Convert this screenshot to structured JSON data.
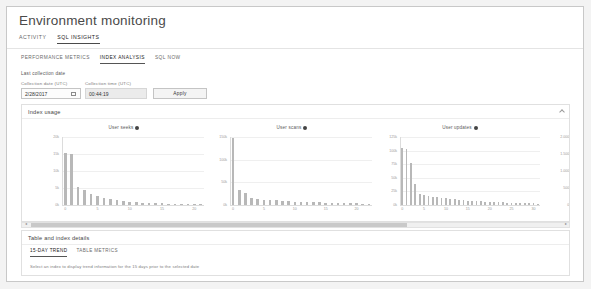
{
  "header": {
    "title": "Environment monitoring",
    "tabs": [
      {
        "label": "ACTIVITY",
        "active": false
      },
      {
        "label": "SQL INSIGHTS",
        "active": true
      }
    ]
  },
  "subtabs": [
    {
      "label": "PERFORMANCE METRICS",
      "active": false
    },
    {
      "label": "INDEX ANALYSIS",
      "active": true
    },
    {
      "label": "SQL NOW",
      "active": false
    }
  ],
  "filters": {
    "section_label": "Last collection date",
    "date_label": "Collection date (UTC)",
    "date_value": "2/28/2017",
    "calendar_icon": "calendar-icon",
    "time_label": "Collection time (UTC)",
    "time_value": "00:44:19",
    "apply_label": "Apply"
  },
  "index_panel": {
    "title": "Index usage",
    "collapse_icon": "chevron-up-icon"
  },
  "table_panel": {
    "title": "Table and index details",
    "tabs": [
      {
        "label": "15-DAY TREND",
        "active": true
      },
      {
        "label": "TABLE METRICS",
        "active": false
      }
    ],
    "hint": "Select an index to display trend information for the 15 days prior to the selected date"
  },
  "scrollbar": {
    "left_arrow": "◂",
    "right_arrow": "▸"
  },
  "chart_data": [
    {
      "type": "bar",
      "title": "User seeks",
      "info_icon": "info-icon",
      "xlabel": "",
      "ylabel": "",
      "ylim": [
        0,
        20000
      ],
      "yticks": [
        0,
        5000,
        10000,
        15000,
        20000
      ],
      "ytick_labels": [
        "0k",
        "5k",
        "10k",
        "15k",
        "20k"
      ],
      "xticks": [
        0,
        5,
        10,
        15,
        20
      ],
      "xtick_labels": [
        "0",
        "5",
        "10",
        "15",
        "20"
      ],
      "categories": [
        "0",
        "1",
        "2",
        "3",
        "4",
        "5",
        "6",
        "7",
        "8",
        "9",
        "10",
        "11",
        "12",
        "13",
        "14",
        "15",
        "16",
        "17",
        "18",
        "19",
        "20",
        "21"
      ],
      "values": [
        15300,
        15100,
        5200,
        4300,
        3100,
        2600,
        2100,
        1700,
        1400,
        1100,
        900,
        800,
        700,
        600,
        520,
        460,
        400,
        360,
        320,
        290,
        260,
        240
      ]
    },
    {
      "type": "bar",
      "title": "User scans",
      "info_icon": "info-icon",
      "xlabel": "",
      "ylabel": "",
      "ylim": [
        0,
        150000
      ],
      "yticks": [
        0,
        50000,
        100000,
        150000
      ],
      "ytick_labels": [
        "0k",
        "50k",
        "100k",
        "150k"
      ],
      "xticks": [
        0,
        5,
        10,
        15,
        20
      ],
      "xtick_labels": [
        "0",
        "5",
        "10",
        "15",
        "20"
      ],
      "categories": [
        "0",
        "1",
        "2",
        "3",
        "4",
        "5",
        "6",
        "7",
        "8",
        "9",
        "10",
        "11",
        "12",
        "13",
        "14",
        "15",
        "16",
        "17",
        "18",
        "19",
        "20",
        "21",
        "22"
      ],
      "values": [
        148000,
        33000,
        26000,
        15000,
        13000,
        12000,
        11000,
        10000,
        9000,
        8200,
        7500,
        7000,
        6500,
        6000,
        5600,
        5200,
        4800,
        4500,
        4200,
        3900,
        3600,
        3300,
        3000
      ]
    },
    {
      "type": "bar",
      "title": "User updates",
      "info_icon": "info-icon",
      "xlabel": "",
      "ylabel": "",
      "ylim": [
        0,
        125000
      ],
      "yticks": [
        0,
        25000,
        50000,
        75000,
        100000,
        125000
      ],
      "ytick_labels": [
        "0k",
        "25k",
        "50k",
        "75k",
        "100k",
        "125k"
      ],
      "xticks": [
        0,
        5,
        10,
        15,
        20,
        25,
        30
      ],
      "xtick_labels": [
        "0",
        "5",
        "10",
        "15",
        "20",
        "25",
        "30"
      ],
      "categories": [
        "0",
        "1",
        "2",
        "3",
        "4",
        "5",
        "6",
        "7",
        "8",
        "9",
        "10",
        "11",
        "12",
        "13",
        "14",
        "15",
        "16",
        "17",
        "18",
        "19",
        "20",
        "21",
        "22",
        "23",
        "24",
        "25",
        "26",
        "27",
        "28",
        "29",
        "30",
        "31"
      ],
      "values": [
        104000,
        103000,
        78000,
        39000,
        21000,
        19000,
        17000,
        15500,
        14000,
        13000,
        12000,
        11000,
        10200,
        9500,
        8800,
        8200,
        7600,
        7100,
        6600,
        6200,
        5800,
        5400,
        5000,
        4700,
        4400,
        4100,
        3800,
        3500,
        3300,
        3100,
        2900,
        2700
      ]
    },
    {
      "type": "bar",
      "title": "",
      "info_icon": "",
      "xlabel": "",
      "ylabel": "",
      "ylim": [
        0,
        2000
      ],
      "yticks": [
        0,
        500,
        1000,
        1500,
        2000
      ],
      "ytick_labels": [
        "0k",
        "500k",
        "1.000k",
        "1.500k",
        "2.000k"
      ],
      "xticks": [
        0
      ],
      "xtick_labels": [
        "0"
      ],
      "categories": [
        "0",
        "1",
        "2",
        "3",
        "4",
        "5"
      ],
      "values": [
        1560,
        1290,
        1280,
        1270,
        1010,
        700
      ]
    }
  ]
}
